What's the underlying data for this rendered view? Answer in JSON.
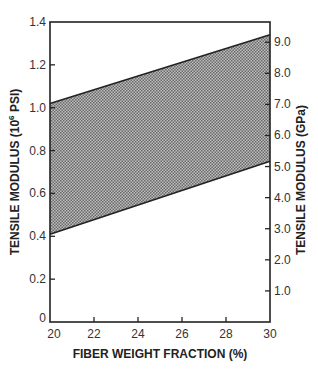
{
  "chart_data": {
    "type": "area",
    "title": "",
    "xlabel": "FIBER WEIGHT FRACTION (%)",
    "ylabel": "TENSILE MODULUS (10^6 PSI)",
    "ylabel_parts": {
      "pre": "TENSILE MODULUS (10",
      "sup": "6",
      "post": " PSI)"
    },
    "y2label": "TENSILE MODULUS (GPa)",
    "xlim": [
      20,
      30
    ],
    "ylim": [
      0,
      1.4
    ],
    "y2lim": [
      0,
      9.65
    ],
    "grid": false,
    "legend": null,
    "x": [
      20,
      30
    ],
    "series": [
      {
        "name": "upper bound",
        "values": [
          1.02,
          1.34
        ]
      },
      {
        "name": "lower bound",
        "values": [
          0.41,
          0.75
        ]
      }
    ],
    "fill_between": "upper bound and lower bound (crosshatched band)",
    "x_ticks": [
      "20",
      "22",
      "24",
      "26",
      "28",
      "30"
    ],
    "x_tick_values": [
      20,
      22,
      24,
      26,
      28,
      30
    ],
    "y_ticks": [
      "0",
      "0.2",
      "0.4",
      "0.6",
      "0.8",
      "1.0",
      "1.2",
      "1.4"
    ],
    "y_tick_values": [
      0,
      0.2,
      0.4,
      0.6,
      0.8,
      1.0,
      1.2,
      1.4
    ],
    "y2_ticks": [
      "1.0",
      "2.0",
      "3.0",
      "4.0",
      "5.0",
      "6.0",
      "7.0",
      "8.0",
      "9.0"
    ],
    "y2_tick_values": [
      1,
      2,
      3,
      4,
      5,
      6,
      7,
      8,
      9
    ]
  }
}
